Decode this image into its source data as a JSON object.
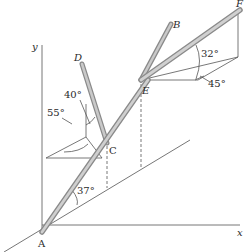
{
  "figure": {
    "axes": {
      "x_label": "x",
      "y_label": "y"
    },
    "points": {
      "A": "A",
      "B": "B",
      "C": "C",
      "D": "D",
      "E": "E",
      "F": "F"
    },
    "angles": {
      "base_angle": "37°",
      "rod_CD_elevation": "40°",
      "rod_CD_azimuth": "55°",
      "rod_EF_elevation": "32°",
      "rod_EF_azimuth": "45°"
    },
    "colors": {
      "rod_fill": "#b9b9b9",
      "rod_edge": "#8a8a8a",
      "line": "#555555"
    }
  }
}
